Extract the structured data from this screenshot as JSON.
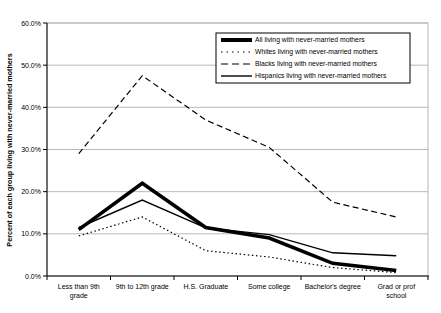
{
  "chart_data": {
    "type": "line",
    "title": "",
    "xlabel": "",
    "ylabel": "Percent of each group living with never-married mothers",
    "ylim": [
      0,
      60
    ],
    "ytick_step": 10,
    "yticks": [
      "0.0%",
      "10.0%",
      "20.0%",
      "30.0%",
      "40.0%",
      "50.0%",
      "60.0%"
    ],
    "grid": true,
    "legend_position": "upper-right-inside",
    "categories": [
      "Less than 9th grade",
      "9th to 12th grade",
      "H.S. Graduate",
      "Some college",
      "Bachelor's degree",
      "Grad or prof school"
    ],
    "category_label_lines": [
      [
        "Less than 9th",
        "grade"
      ],
      [
        "9th to 12th grade"
      ],
      [
        "H.S. Graduate"
      ],
      [
        "Some college"
      ],
      [
        "Bachelor's degree"
      ],
      [
        "Grad or prof",
        "school"
      ]
    ],
    "series": [
      {
        "name": "All living with never-married mothers",
        "style": "thick-solid",
        "values": [
          11.0,
          22.0,
          11.5,
          9.0,
          3.0,
          1.3
        ]
      },
      {
        "name": "Whites living with never-married mothers",
        "style": "dotted",
        "values": [
          9.5,
          14.0,
          6.0,
          4.5,
          2.0,
          0.8
        ]
      },
      {
        "name": "Blacks living with never-married mothers",
        "style": "dashed",
        "values": [
          29.0,
          47.5,
          37.0,
          30.5,
          17.5,
          14.0
        ]
      },
      {
        "name": "Hispanics living with never-married mothers",
        "style": "thin-solid",
        "values": [
          11.5,
          18.0,
          11.4,
          9.8,
          5.5,
          4.8
        ]
      }
    ],
    "colors": {
      "line": "#000000",
      "grid": "#b8b8b8",
      "plot_border": "#b8b8b8",
      "axis": "#000000",
      "background": "#ffffff"
    }
  }
}
